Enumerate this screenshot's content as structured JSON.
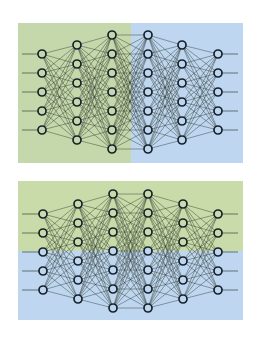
{
  "figure": {
    "width": 262,
    "height": 343,
    "background": "#ffffff",
    "node_radius": 4,
    "node_stroke": "#16212b",
    "node_stroke_width": 1.7,
    "edge_color": "#2e3a30",
    "edge_width": 0.6,
    "edge_opacity": 0.75,
    "colors": {
      "green": "#c6d9ad",
      "blue": "#bed6f0"
    }
  },
  "diagrams": [
    {
      "id": "vertical-split-network",
      "split": "vertical",
      "box": {
        "x": 18,
        "y": 23,
        "w": 225,
        "h": 140
      },
      "split_at": 131,
      "regions": [
        {
          "name": "green-region",
          "color": "#c5d8ab",
          "x": 18,
          "y": 23,
          "w": 113,
          "h": 140
        },
        {
          "name": "blue-region",
          "color": "#bed6f0",
          "x": 131,
          "y": 23,
          "w": 112,
          "h": 140
        }
      ],
      "input_line_start": 22,
      "output_line_end": 238,
      "layers": [
        {
          "x": 42,
          "nodes": [
            54,
            73,
            92,
            111,
            130
          ]
        },
        {
          "x": 77,
          "nodes": [
            45,
            64,
            83,
            102,
            121,
            140
          ]
        },
        {
          "x": 112,
          "nodes": [
            35,
            54,
            73,
            92,
            111,
            130,
            149
          ]
        },
        {
          "x": 148,
          "nodes": [
            35,
            54,
            73,
            92,
            111,
            130,
            149
          ]
        },
        {
          "x": 182,
          "nodes": [
            45,
            64,
            83,
            102,
            121,
            140
          ]
        },
        {
          "x": 218,
          "nodes": [
            54,
            73,
            92,
            111,
            130
          ]
        }
      ]
    },
    {
      "id": "horizontal-split-network",
      "split": "horizontal",
      "box": {
        "x": 18,
        "y": 181,
        "w": 225,
        "h": 139
      },
      "split_at": 251,
      "regions": [
        {
          "name": "green-region",
          "color": "#c9dba9",
          "x": 18,
          "y": 181,
          "w": 225,
          "h": 70
        },
        {
          "name": "blue-region",
          "color": "#bed6f0",
          "x": 18,
          "y": 251,
          "w": 225,
          "h": 69
        }
      ],
      "input_line_start": 22,
      "output_line_end": 238,
      "layers": [
        {
          "x": 43,
          "nodes": [
            214,
            233,
            252,
            271,
            290
          ]
        },
        {
          "x": 78,
          "nodes": [
            204,
            223,
            242,
            261,
            280,
            299
          ]
        },
        {
          "x": 113,
          "nodes": [
            194,
            213,
            232,
            251,
            270,
            289,
            308
          ]
        },
        {
          "x": 148,
          "nodes": [
            194,
            213,
            232,
            251,
            270,
            289,
            308
          ]
        },
        {
          "x": 183,
          "nodes": [
            204,
            223,
            242,
            261,
            280,
            299
          ]
        },
        {
          "x": 218,
          "nodes": [
            214,
            233,
            252,
            271,
            290
          ]
        }
      ]
    }
  ]
}
